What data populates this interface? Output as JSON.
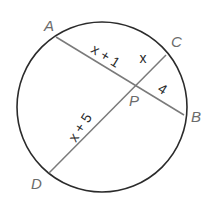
{
  "diagram": {
    "type": "circle-intersecting-chords",
    "circle": {
      "cx": 102,
      "cy": 107,
      "r": 85,
      "stroke": "#2b2b2b"
    },
    "chord_color": "#7a7a7a",
    "points": {
      "A": {
        "label": "A",
        "x": 56,
        "y": 37,
        "label_x": 44,
        "label_y": 31
      },
      "B": {
        "label": "B",
        "x": 184,
        "y": 115,
        "label_x": 191,
        "label_y": 122
      },
      "C": {
        "label": "C",
        "x": 166,
        "y": 55,
        "label_x": 171,
        "label_y": 47
      },
      "D": {
        "label": "D",
        "x": 49,
        "y": 173,
        "label_x": 31,
        "label_y": 189
      },
      "P": {
        "label": "P",
        "x": 135,
        "y": 86,
        "label_x": 129,
        "label_y": 106
      }
    },
    "chords": [
      {
        "from": "A",
        "to": "B"
      },
      {
        "from": "C",
        "to": "D"
      }
    ],
    "segment_labels": {
      "AP": {
        "text": "x + 1",
        "x": 103,
        "y": 60,
        "angle": 32
      },
      "CP": {
        "text": "x",
        "x": 143,
        "y": 63,
        "angle": 0
      },
      "PB": {
        "text": "4",
        "x": 160,
        "y": 93,
        "angle": 32
      },
      "DP": {
        "text": "x + 5",
        "x": 84,
        "y": 130,
        "angle": -57
      }
    }
  }
}
